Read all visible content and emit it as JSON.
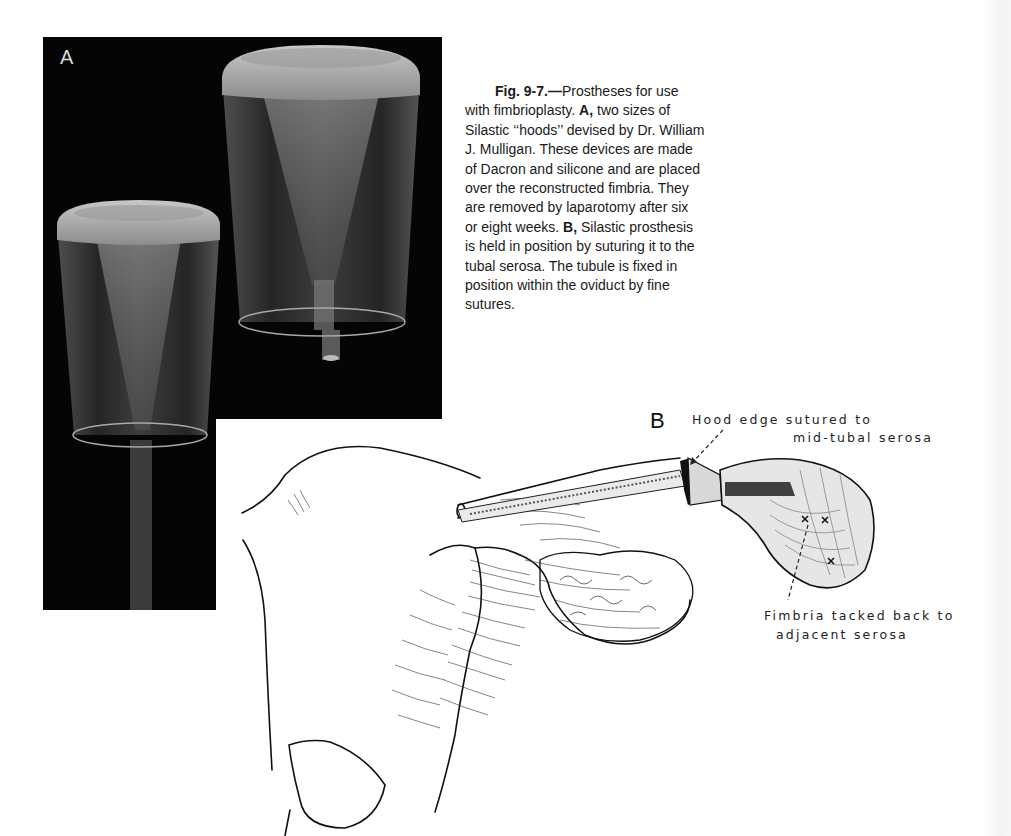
{
  "figure": {
    "number": "Fig. 9-7.—",
    "caption_segments": [
      {
        "bold": true,
        "text": "Fig. 9-7.—"
      },
      {
        "bold": false,
        "text": "Prostheses for use with fimbrioplasty. "
      },
      {
        "bold": true,
        "text": "A,"
      },
      {
        "bold": false,
        "text": " two sizes of Silastic ‘‘hoods’’ devised by Dr. William J. Mulligan. These devices are made of Dacron and silicone and are placed over the reconstructed fimbria. They are removed by laparotomy after six or eight weeks. "
      },
      {
        "bold": true,
        "text": "B,"
      },
      {
        "bold": false,
        "text": " Silastic prosthesis is held in position by suturing it to the tubal serosa. The tubule is fixed in position within the oviduct by fine sutures."
      }
    ],
    "caption_lines": [
      "Prostheses for use",
      "with fimbrioplasty.",
      "two sizes of",
      "Silastic ‘‘hoods’’ devised by Dr. William",
      "J. Mulligan. These devices are made",
      "of Dacron and silicone and are placed",
      "over the reconstructed fimbria. They",
      "are removed by laparotomy after six",
      "or eight weeks.",
      "Silastic prosthesis",
      "is held in position by suturing it to the",
      "tubal serosa. The tubule is fixed in",
      "position within the oviduct by fine",
      "sutures."
    ],
    "bold_labels": {
      "fig": "Fig. 9-7.—",
      "a": "A,",
      "b": "B,"
    }
  },
  "panel_a": {
    "label": "A",
    "description": "Photograph of two Silastic hoods (small and large) on black background"
  },
  "panel_b": {
    "label": "B",
    "annotations": {
      "hood_edge_line1": "Hood edge sutured to",
      "hood_edge_line2": "mid-tubal serosa",
      "fimbria_line1": "Fimbria tacked back to",
      "fimbria_line2": "adjacent serosa"
    }
  }
}
